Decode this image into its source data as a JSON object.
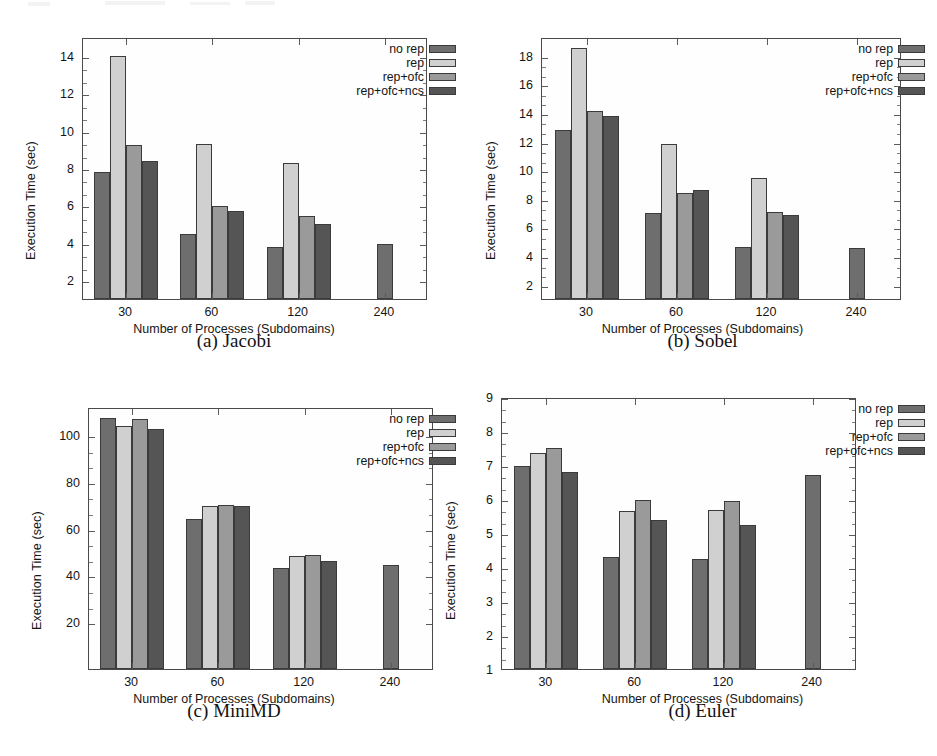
{
  "figure": {
    "series_labels": [
      "no rep",
      "rep",
      "rep+ofc",
      "rep+ofc+ncs"
    ],
    "series_colors": [
      "#6e6e6e",
      "#d0d0d0",
      "#9a9a9a",
      "#555555"
    ],
    "xlabel": "Number of Processes (Subdomains)",
    "ylabel": "Execution Time (sec)",
    "categories": [
      "30",
      "60",
      "120",
      "240"
    ],
    "captions": {
      "a": "(a) Jacobi",
      "b": "(b) Sobel",
      "c": "(c) MiniMD",
      "d": "(d) Euler"
    }
  },
  "chart_data": [
    {
      "type": "bar",
      "id": "jacobi",
      "title": "(a) Jacobi",
      "xlabel": "Number of Processes (Subdomains)",
      "ylabel": "Execution Time (sec)",
      "categories": [
        "30",
        "60",
        "120",
        "240"
      ],
      "ylim": [
        1,
        15
      ],
      "yticks": [
        2,
        4,
        6,
        8,
        10,
        12,
        14
      ],
      "grid": false,
      "legend_position": "top-right",
      "series": [
        {
          "name": "no rep",
          "values": [
            7.8,
            4.5,
            3.8,
            3.95
          ]
        },
        {
          "name": "rep",
          "values": [
            14.0,
            9.3,
            8.25,
            null
          ]
        },
        {
          "name": "rep+ofc",
          "values": [
            9.25,
            5.95,
            5.45,
            null
          ]
        },
        {
          "name": "rep+ofc+ncs",
          "values": [
            8.35,
            5.7,
            5.0,
            null
          ]
        }
      ]
    },
    {
      "type": "bar",
      "id": "sobel",
      "title": "(b) Sobel",
      "xlabel": "Number of Processes (Subdomains)",
      "ylabel": "Execution Time (sec)",
      "categories": [
        "30",
        "60",
        "120",
        "240"
      ],
      "ylim": [
        1,
        19.3
      ],
      "yticks": [
        2,
        4,
        6,
        8,
        10,
        12,
        14,
        16,
        18
      ],
      "grid": false,
      "legend_position": "top-right",
      "series": [
        {
          "name": "no rep",
          "values": [
            12.8,
            7.0,
            4.65,
            4.55
          ]
        },
        {
          "name": "rep",
          "values": [
            18.5,
            11.8,
            9.45,
            null
          ]
        },
        {
          "name": "rep+ofc",
          "values": [
            14.1,
            8.4,
            7.05,
            null
          ]
        },
        {
          "name": "rep+ofc+ncs",
          "values": [
            13.75,
            8.6,
            6.85,
            null
          ]
        }
      ]
    },
    {
      "type": "bar",
      "id": "minimd",
      "title": "(c) MiniMD",
      "xlabel": "Number of Processes (Subdomains)",
      "ylabel": "Execution Time (sec)",
      "categories": [
        "30",
        "60",
        "120",
        "240"
      ],
      "ylim": [
        0,
        112
      ],
      "yticks": [
        20,
        40,
        60,
        80,
        100
      ],
      "grid": false,
      "legend_position": "top-right",
      "series": [
        {
          "name": "no rep",
          "values": [
            107.5,
            64.0,
            43.0,
            44.5
          ]
        },
        {
          "name": "rep",
          "values": [
            104.0,
            69.5,
            48.3,
            null
          ]
        },
        {
          "name": "rep+ofc",
          "values": [
            107.0,
            70.0,
            48.7,
            null
          ]
        },
        {
          "name": "rep+ofc+ncs",
          "values": [
            102.5,
            69.5,
            46.3,
            null
          ]
        }
      ]
    },
    {
      "type": "bar",
      "id": "euler",
      "title": "(d) Euler",
      "xlabel": "Number of Processes (Subdomains)",
      "ylabel": "Execution Time (sec)",
      "categories": [
        "30",
        "60",
        "120",
        "240"
      ],
      "ylim": [
        1,
        9
      ],
      "yticks": [
        1,
        2,
        3,
        4,
        5,
        6,
        7,
        8,
        9
      ],
      "grid": false,
      "legend_position": "top-right",
      "series": [
        {
          "name": "no rep",
          "values": [
            6.97,
            4.28,
            4.23,
            6.7
          ]
        },
        {
          "name": "rep",
          "values": [
            7.35,
            5.65,
            5.68,
            null
          ]
        },
        {
          "name": "rep+ofc",
          "values": [
            7.5,
            5.98,
            5.95,
            null
          ]
        },
        {
          "name": "rep+ofc+ncs",
          "values": [
            6.78,
            5.38,
            5.25,
            null
          ]
        }
      ]
    }
  ]
}
